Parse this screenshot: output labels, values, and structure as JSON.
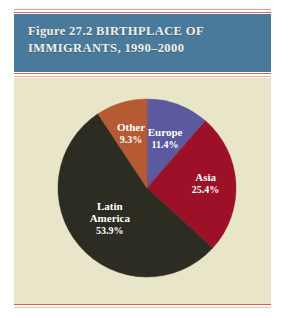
{
  "figure": {
    "header_line_1": "Figure 27.2 BIRTHPLACE OF",
    "header_line_2": "IMMIGRANTS, 1990–2000"
  },
  "colors": {
    "header_band": "#4a7a9b",
    "header_text": "#f2efe4",
    "panel_background": "#e9e5c9",
    "rule_orange": "#d4674a",
    "rule_salmon": "#e9b2a0",
    "label_text": "#ffffff"
  },
  "chart_data": {
    "type": "pie",
    "title": "Figure 27.2 BIRTHPLACE OF IMMIGRANTS, 1990–2000",
    "categories": [
      "Europe",
      "Asia",
      "Latin America",
      "Other"
    ],
    "values": [
      11.4,
      25.4,
      53.9,
      9.3
    ],
    "value_labels": [
      "11.4%",
      "25.4%",
      "53.9%",
      "9.3%"
    ],
    "colors": [
      "#5b5a9e",
      "#9c1127",
      "#2c2c22",
      "#b55a32"
    ],
    "start_angle_deg": 0,
    "direction": "clockwise",
    "units": "percent",
    "legend": "none",
    "labels_inside": true,
    "slices": [
      {
        "name": "Europe",
        "value": 11.4,
        "label": "Europe",
        "value_label": "11.4%",
        "color": "#5b5a9e"
      },
      {
        "name": "Asia",
        "value": 25.4,
        "label": "Asia",
        "value_label": "25.4%",
        "color": "#9c1127"
      },
      {
        "name": "Latin America",
        "value": 53.9,
        "label": "Latin\nAmerica",
        "value_label": "53.9%",
        "color": "#2c2c22",
        "label_line_1": "Latin",
        "label_line_2": "America"
      },
      {
        "name": "Other",
        "value": 9.3,
        "label": "Other",
        "value_label": "9.3%",
        "color": "#b55a32"
      }
    ]
  }
}
